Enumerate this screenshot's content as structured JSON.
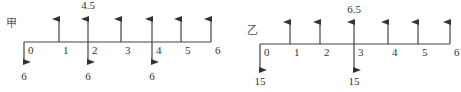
{
  "diagrams": [
    {
      "label": "甲",
      "axis": {
        "y": 42,
        "x_start": 24,
        "x_end": 211
      },
      "label_pos": {
        "x": 6,
        "y": 27
      },
      "ticks": [
        {
          "t": "0",
          "x": 24
        },
        {
          "t": "1",
          "x": 59
        },
        {
          "t": "2",
          "x": 88
        },
        {
          "t": "3",
          "x": 121
        },
        {
          "t": "4",
          "x": 152
        },
        {
          "t": "5",
          "x": 181
        },
        {
          "t": "6",
          "x": 211
        }
      ],
      "inflows": [
        {
          "period": 1,
          "x": 59,
          "label": ""
        },
        {
          "period": 2,
          "x": 88,
          "label": "4.5"
        },
        {
          "period": 3,
          "x": 121,
          "label": ""
        },
        {
          "period": 4,
          "x": 152,
          "label": ""
        },
        {
          "period": 5,
          "x": 181,
          "label": ""
        },
        {
          "period": 6,
          "x": 211,
          "label": ""
        }
      ],
      "outflows": [
        {
          "period": 0,
          "x": 24,
          "label": "6"
        },
        {
          "period": 2,
          "x": 88,
          "label": "6"
        },
        {
          "period": 4,
          "x": 152,
          "label": "6"
        }
      ],
      "up_top": 17,
      "down_bottom": 64,
      "up_label_y": 13,
      "down_label_y": 80
    },
    {
      "label": "乙",
      "axis": {
        "y": 44,
        "x_start": 260,
        "x_end": 450
      },
      "label_pos": {
        "x": 247,
        "y": 34
      },
      "ticks": [
        {
          "t": "0",
          "x": 260
        },
        {
          "t": "1",
          "x": 290
        },
        {
          "t": "2",
          "x": 320
        },
        {
          "t": "3",
          "x": 354
        },
        {
          "t": "4",
          "x": 388
        },
        {
          "t": "5",
          "x": 418
        },
        {
          "t": "6",
          "x": 450
        }
      ],
      "inflows": [
        {
          "period": 1,
          "x": 290,
          "label": ""
        },
        {
          "period": 2,
          "x": 320,
          "label": ""
        },
        {
          "period": 3,
          "x": 354,
          "label": "6.5"
        },
        {
          "period": 4,
          "x": 388,
          "label": ""
        },
        {
          "period": 5,
          "x": 418,
          "label": ""
        },
        {
          "period": 6,
          "x": 450,
          "label": ""
        }
      ],
      "outflows": [
        {
          "period": 0,
          "x": 260,
          "label": "15"
        },
        {
          "period": 3,
          "x": 354,
          "label": "15"
        }
      ],
      "up_top": 20,
      "down_bottom": 72,
      "up_label_y": 17,
      "down_label_y": 85
    }
  ]
}
